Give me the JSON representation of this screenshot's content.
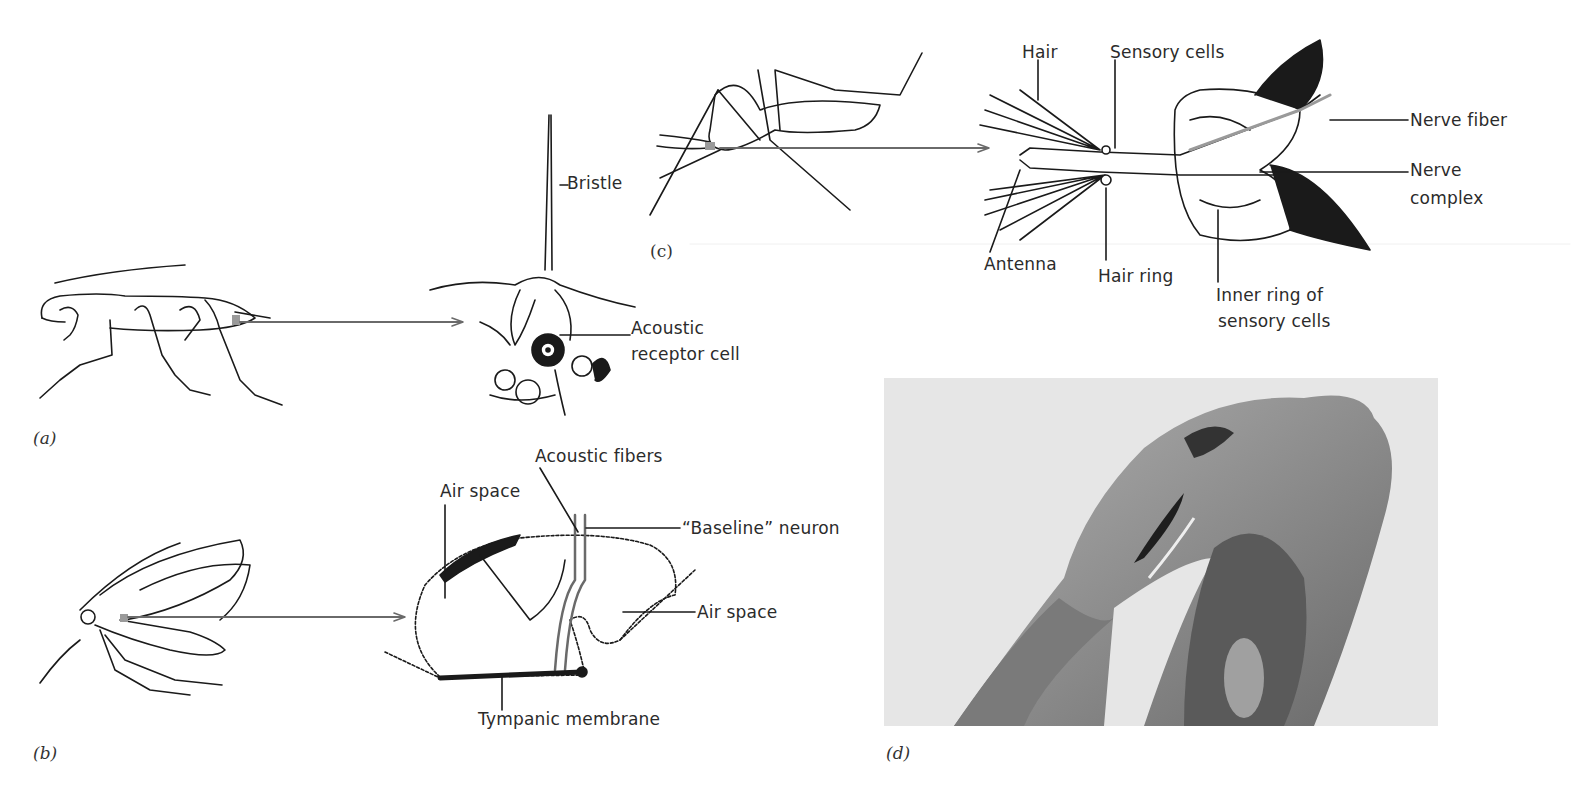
{
  "panels": {
    "a": {
      "caption": "(a)",
      "subject": "cricket",
      "labels": {
        "bristle": "Bristle",
        "receptor_line1": "Acoustic",
        "receptor_line2": "receptor cell"
      }
    },
    "b": {
      "caption": "(b)",
      "subject": "moth",
      "labels": {
        "acoustic_fibers": "Acoustic fibers",
        "air_space_left": "Air space",
        "baseline_neuron": "“Baseline” neuron",
        "air_space_right": "Air space",
        "tympanic_membrane": "Tympanic membrane"
      }
    },
    "c": {
      "caption": "(c)",
      "subject": "mosquito",
      "labels": {
        "hair": "Hair",
        "sensory_cells": "Sensory cells",
        "nerve_fiber": "Nerve fiber",
        "nerve_complex_line1": "Nerve",
        "nerve_complex_line2": "complex",
        "antenna": "Antenna",
        "hair_ring": "Hair ring",
        "inner_ring_line1": "Inner ring of",
        "inner_ring_line2": "sensory cells"
      }
    },
    "d": {
      "caption": "(d)",
      "subject": "photograph of ear section"
    }
  },
  "colors": {
    "ink": "#1a1a1a",
    "pointer": "#6a6a6a",
    "highlight": "#9a9a9a",
    "photo_bg": "#e6e6e6"
  }
}
